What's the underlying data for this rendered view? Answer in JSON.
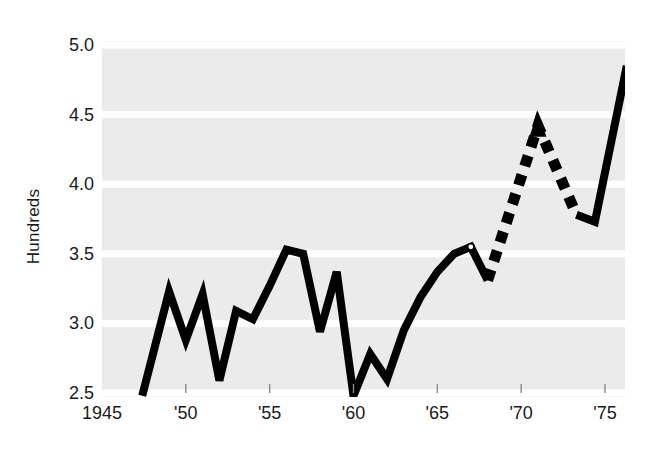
{
  "chart_data": {
    "type": "line",
    "title": "",
    "xlabel": "",
    "ylabel": "Hundreds",
    "xlim": [
      1945,
      1976.5
    ],
    "ylim": [
      2.45,
      5.02
    ],
    "grid": true,
    "grid_color": "#ffffff",
    "background_color": "#ebebeb",
    "line_color": "#000000",
    "legend": "none",
    "xticks": [
      1945,
      1950,
      1955,
      1960,
      1965,
      1970,
      1975
    ],
    "xticklabels": [
      "1945",
      "'50",
      "'55",
      "'60",
      "'65",
      "'70",
      "'75"
    ],
    "yticks": [
      2.5,
      3.0,
      3.5,
      4.0,
      4.5,
      5.0
    ],
    "yticklabels": [
      "2.5",
      "3.0",
      "3.5",
      "4.0",
      "4.5",
      "5.0"
    ],
    "series": [
      {
        "name": "solid-history",
        "style": "solid",
        "x": [
          1947.4,
          1949.0,
          1950.0,
          1951.0,
          1952.0,
          1953.0,
          1954.0,
          1955.0,
          1956.0,
          1957.0,
          1958.0,
          1959.0,
          1960.0,
          1961.0,
          1962.0,
          1963.0,
          1964.0,
          1965.0,
          1966.0,
          1967.0,
          1968.0
        ],
        "y": [
          2.48,
          3.23,
          2.88,
          3.21,
          2.59,
          3.09,
          3.03,
          3.27,
          3.53,
          3.5,
          2.94,
          3.37,
          2.48,
          2.78,
          2.6,
          2.95,
          3.19,
          3.37,
          3.5,
          3.55,
          3.31
        ]
      },
      {
        "name": "dashed-projection",
        "style": "dashed",
        "x": [
          1968.0,
          1971.0,
          1973.3
        ],
        "y": [
          3.31,
          4.42,
          3.78
        ]
      },
      {
        "name": "solid-resume",
        "style": "solid",
        "x": [
          1973.3,
          1974.4,
          1976.3
        ],
        "y": [
          3.78,
          3.73,
          4.85
        ]
      }
    ],
    "markers": [
      {
        "name": "open-circle-marker",
        "x": 1967.0,
        "y": 3.55,
        "shape": "circle",
        "fill": "#ffffff",
        "edge": "#000000"
      }
    ],
    "annotations": [
      {
        "name": "arrowhead",
        "x": 1971.0,
        "y": 4.42,
        "shape": "triangle-up",
        "color": "#000000"
      }
    ]
  }
}
